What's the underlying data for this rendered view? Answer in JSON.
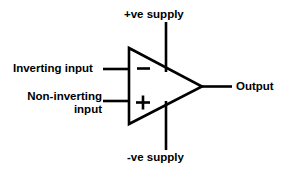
{
  "diagram": {
    "stroke_color": "#000000",
    "background_color": "#ffffff",
    "labels": {
      "positive_supply": "+ve supply",
      "negative_supply": "-ve supply",
      "inverting_input": "Inverting input",
      "non_inverting_input_line1": "Non-inverting",
      "non_inverting_input_line2": "input",
      "output": "Output"
    },
    "terminal_symbols": {
      "inverting": "–",
      "non_inverting": "+"
    }
  }
}
